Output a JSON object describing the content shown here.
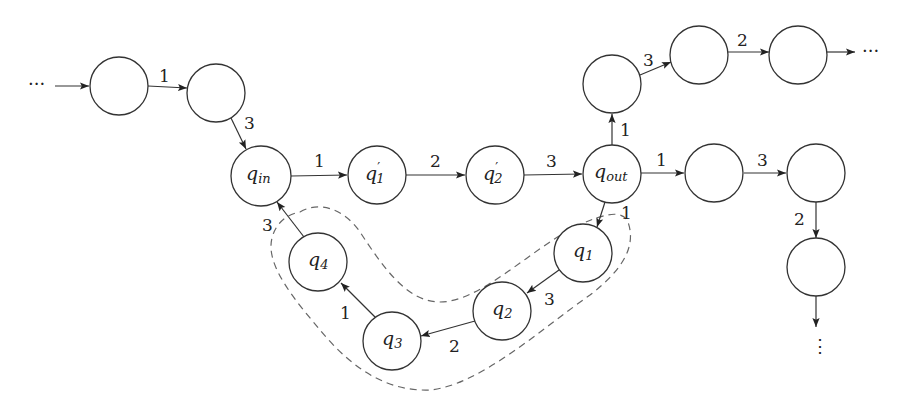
{
  "diagram": {
    "type": "state-transition-graph",
    "nodes": [
      {
        "id": "a",
        "label": "",
        "x": 119,
        "y": 86
      },
      {
        "id": "b",
        "label": "",
        "x": 216,
        "y": 93
      },
      {
        "id": "q_in",
        "label": "q",
        "sub": "in",
        "x": 261,
        "y": 176
      },
      {
        "id": "q1p",
        "label": "q",
        "sub": "1",
        "prime": true,
        "x": 377,
        "y": 175
      },
      {
        "id": "q2p",
        "label": "q",
        "sub": "2",
        "prime": true,
        "x": 495,
        "y": 175
      },
      {
        "id": "q_out",
        "label": "q",
        "sub": "out",
        "x": 612,
        "y": 174
      },
      {
        "id": "u1",
        "label": "",
        "x": 612,
        "y": 84
      },
      {
        "id": "u2",
        "label": "",
        "x": 699,
        "y": 55
      },
      {
        "id": "u3",
        "label": "",
        "x": 798,
        "y": 55
      },
      {
        "id": "r1",
        "label": "",
        "x": 714,
        "y": 173
      },
      {
        "id": "r2",
        "label": "",
        "x": 816,
        "y": 173
      },
      {
        "id": "r3",
        "label": "",
        "x": 816,
        "y": 267
      },
      {
        "id": "q1",
        "label": "q",
        "sub": "1",
        "x": 583,
        "y": 253
      },
      {
        "id": "q2",
        "label": "q",
        "sub": "2",
        "x": 502,
        "y": 311
      },
      {
        "id": "q3",
        "label": "q",
        "sub": "3",
        "x": 392,
        "y": 341
      },
      {
        "id": "q4",
        "label": "q",
        "sub": "4",
        "x": 318,
        "y": 262
      }
    ],
    "edges": [
      {
        "from": "start",
        "to": "a",
        "label": ""
      },
      {
        "from": "a",
        "to": "b",
        "label": "1"
      },
      {
        "from": "b",
        "to": "q_in",
        "label": "3"
      },
      {
        "from": "q_in",
        "to": "q1p",
        "label": "1"
      },
      {
        "from": "q1p",
        "to": "q2p",
        "label": "2"
      },
      {
        "from": "q2p",
        "to": "q_out",
        "label": "3"
      },
      {
        "from": "q_out",
        "to": "u1",
        "label": "1"
      },
      {
        "from": "u1",
        "to": "u2",
        "label": "3"
      },
      {
        "from": "u2",
        "to": "u3",
        "label": "2"
      },
      {
        "from": "u3",
        "to": "end-right",
        "label": ""
      },
      {
        "from": "q_out",
        "to": "r1",
        "label": "1"
      },
      {
        "from": "r1",
        "to": "r2",
        "label": "3"
      },
      {
        "from": "r2",
        "to": "r3",
        "label": "2"
      },
      {
        "from": "r3",
        "to": "end-down",
        "label": ""
      },
      {
        "from": "q_out",
        "to": "q1",
        "label": "1"
      },
      {
        "from": "q1",
        "to": "q2",
        "label": "3"
      },
      {
        "from": "q2",
        "to": "q3",
        "label": "2"
      },
      {
        "from": "q3",
        "to": "q4",
        "label": "1"
      },
      {
        "from": "q4",
        "to": "q_in",
        "label": "3"
      }
    ],
    "ellipsis": {
      "left": "···",
      "right": "···",
      "bottom": "⋮"
    },
    "dashed_region": "encloses q1, q2, q3, q4",
    "colors": {
      "stroke": "#333333",
      "dashed": "#666666",
      "background": "#ffffff"
    }
  }
}
